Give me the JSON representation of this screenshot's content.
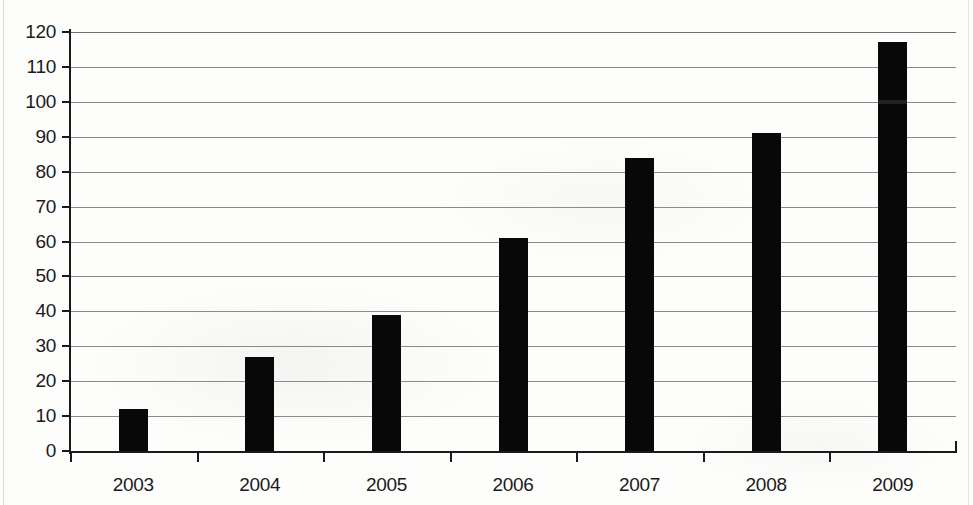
{
  "chart_data": {
    "type": "bar",
    "title": "",
    "subtitle": "",
    "xlabel": "",
    "ylabel": "",
    "categories": [
      "2003",
      "2004",
      "2005",
      "2006",
      "2007",
      "2008",
      "2009"
    ],
    "values": [
      12,
      27,
      39,
      61,
      84,
      91,
      117
    ],
    "ylim": [
      0,
      120
    ],
    "ytick_interval": 10,
    "ytick_labels": [
      "0",
      "10",
      "20",
      "30",
      "40",
      "50",
      "60",
      "70",
      "80",
      "90",
      "100",
      "110",
      "120"
    ],
    "ytick_values": [
      0,
      10,
      20,
      30,
      40,
      50,
      60,
      70,
      80,
      90,
      100,
      110,
      120
    ],
    "grid": true,
    "grid_axis": "y",
    "legend": false,
    "legend_position": "none",
    "series": [
      {
        "name": "",
        "values": [
          12,
          27,
          39,
          61,
          84,
          91,
          117
        ],
        "color": "#080808"
      }
    ],
    "colors": {
      "bar": "#080808",
      "gridline": "#8a8a8a",
      "axis": "#1a1a1a",
      "background": "#fdfdfc",
      "text": "#1b1b1b"
    }
  }
}
